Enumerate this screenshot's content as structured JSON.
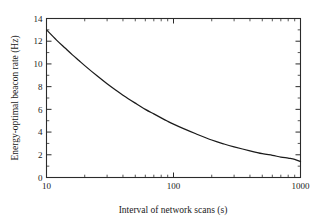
{
  "chart_data": {
    "type": "line",
    "title": "",
    "subtitle": "",
    "xlabel": "Interval of network scans (s)",
    "ylabel": "Energy-optimal beacon rate (Hz)",
    "xscale": "log",
    "yscale": "linear",
    "xlim": [
      10,
      1000
    ],
    "ylim": [
      0,
      14
    ],
    "grid": false,
    "legend": null,
    "legend_position": "none",
    "x_tick_labels": [
      "10",
      "100",
      "1000"
    ],
    "x_tick_values": [
      10,
      100,
      1000
    ],
    "x_minor_ticks": [
      20,
      30,
      40,
      50,
      60,
      70,
      80,
      90,
      200,
      300,
      400,
      500,
      600,
      700,
      800,
      900
    ],
    "y_tick_labels": [
      "0",
      "2",
      "4",
      "6",
      "8",
      "10",
      "12",
      "14"
    ],
    "y_tick_values": [
      0,
      2,
      4,
      6,
      8,
      10,
      12,
      14
    ],
    "y_minor_ticks": [
      1,
      3,
      5,
      7,
      9,
      11,
      13
    ],
    "tick_direction": "in",
    "frame": "box",
    "series": [
      {
        "name": "Energy-optimal beacon rate",
        "color": "#1b1b1b",
        "x": [
          10,
          12,
          14,
          16,
          18,
          20,
          25,
          30,
          35,
          40,
          50,
          60,
          70,
          80,
          90,
          100,
          120,
          150,
          200,
          250,
          300,
          400,
          500,
          600,
          700,
          800,
          900,
          1000
        ],
        "values": [
          13.0,
          12.1,
          11.4,
          10.8,
          10.3,
          9.85,
          8.95,
          8.25,
          7.7,
          7.25,
          6.55,
          6.0,
          5.6,
          5.25,
          4.95,
          4.7,
          4.3,
          3.85,
          3.3,
          2.95,
          2.7,
          2.35,
          2.1,
          1.95,
          1.8,
          1.7,
          1.6,
          1.4
        ]
      }
    ]
  },
  "axes": {
    "x_title": "Interval of network scans (s)",
    "y_title": "Energy-optimal beacon rate (Hz)"
  }
}
